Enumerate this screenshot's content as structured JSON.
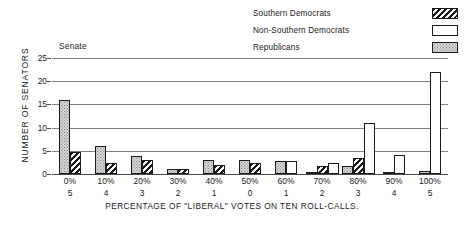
{
  "panel_label": "Senate",
  "legend": {
    "items": [
      {
        "label": "Southern Democrats",
        "pattern": "diagonal-hatch",
        "color": "#1a1a1a"
      },
      {
        "label": "Non-Southern Democrats",
        "pattern": "empty-white",
        "color": "#ffffff"
      },
      {
        "label": "Republicans",
        "pattern": "gray-stipple",
        "color": "#d6d6d6"
      }
    ]
  },
  "chart_data": {
    "type": "bar",
    "title": "Senate",
    "xlabel": "PERCENTAGE OF \"LIBERAL\" VOTES ON TEN ROLL-CALLS.",
    "ylabel": "NUMBER OF SENATORS",
    "categories": [
      "0%",
      "10%",
      "20%",
      "30%",
      "40%",
      "50%",
      "60%",
      "70%",
      "80%",
      "90%",
      "100%"
    ],
    "secondary_tick_labels": [
      "5",
      "4",
      "3",
      "2",
      "1",
      "0",
      "1",
      "2",
      "3",
      "4",
      "5"
    ],
    "ylim": [
      0,
      25
    ],
    "yticks": [
      0,
      5,
      10,
      15,
      20,
      25
    ],
    "grid": true,
    "legend_position": "top-right",
    "series": [
      {
        "name": "Republicans",
        "pattern": "gray-stipple",
        "values": [
          16,
          6,
          3.8,
          1,
          3,
          3,
          2.8,
          0.4,
          1.8,
          0.5,
          0.7
        ]
      },
      {
        "name": "Southern Democrats",
        "pattern": "diagonal-hatch",
        "values": [
          4.7,
          2.4,
          3.1,
          1,
          2,
          2.3,
          0,
          1.7,
          3.4,
          0,
          0
        ]
      },
      {
        "name": "Non-Southern Democrats",
        "pattern": "empty-white",
        "values": [
          0,
          0,
          0,
          0,
          0,
          0,
          2.8,
          2.4,
          11,
          4.1,
          22
        ]
      }
    ],
    "groups": [
      {
        "x": "0%",
        "sub": "5",
        "bars": [
          {
            "series": "Republicans",
            "value": 16
          },
          {
            "series": "Southern Democrats",
            "value": 4.7
          }
        ]
      },
      {
        "x": "10%",
        "sub": "4",
        "bars": [
          {
            "series": "Republicans",
            "value": 6
          },
          {
            "series": "Southern Democrats",
            "value": 2.4
          }
        ]
      },
      {
        "x": "20%",
        "sub": "3",
        "bars": [
          {
            "series": "Republicans",
            "value": 3.8
          },
          {
            "series": "Southern Democrats",
            "value": 3.1
          }
        ]
      },
      {
        "x": "30%",
        "sub": "2",
        "bars": [
          {
            "series": "Republicans",
            "value": 1
          },
          {
            "series": "Southern Democrats",
            "value": 1
          }
        ]
      },
      {
        "x": "40%",
        "sub": "1",
        "bars": [
          {
            "series": "Republicans",
            "value": 3
          },
          {
            "series": "Southern Democrats",
            "value": 2
          }
        ]
      },
      {
        "x": "50%",
        "sub": "0",
        "bars": [
          {
            "series": "Republicans",
            "value": 3
          },
          {
            "series": "Southern Democrats",
            "value": 2.3
          }
        ]
      },
      {
        "x": "60%",
        "sub": "1",
        "bars": [
          {
            "series": "Republicans",
            "value": 2.8
          },
          {
            "series": "Non-Southern Democrats",
            "value": 2.8
          }
        ]
      },
      {
        "x": "70%",
        "sub": "2",
        "bars": [
          {
            "series": "Republicans",
            "value": 0.4
          },
          {
            "series": "Southern Democrats",
            "value": 1.7
          },
          {
            "series": "Non-Southern Democrats",
            "value": 2.4
          }
        ]
      },
      {
        "x": "80%",
        "sub": "3",
        "bars": [
          {
            "series": "Republicans",
            "value": 1.8
          },
          {
            "series": "Southern Democrats",
            "value": 3.4
          },
          {
            "series": "Non-Southern Democrats",
            "value": 11
          }
        ]
      },
      {
        "x": "90%",
        "sub": "4",
        "bars": [
          {
            "series": "Republicans",
            "value": 0.5
          },
          {
            "series": "Non-Southern Democrats",
            "value": 4.1
          }
        ]
      },
      {
        "x": "100%",
        "sub": "5",
        "bars": [
          {
            "series": "Republicans",
            "value": 0.7
          },
          {
            "series": "Non-Southern Democrats",
            "value": 22
          }
        ]
      }
    ]
  }
}
